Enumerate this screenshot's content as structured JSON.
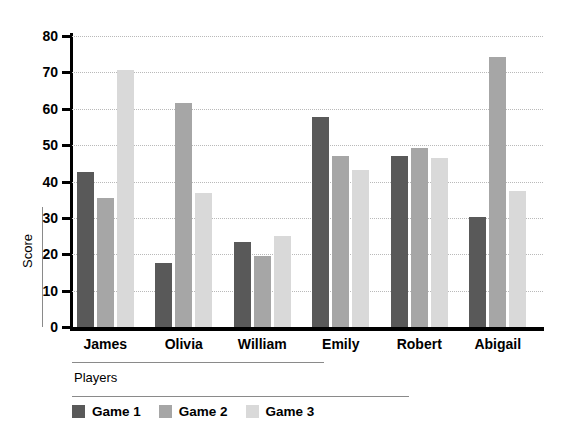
{
  "chart_data": {
    "type": "bar",
    "title": "",
    "subtitle": "",
    "xlabel": "Players",
    "ylabel": "Score",
    "categories": [
      "James",
      "Olivia",
      "William",
      "Emily",
      "Robert",
      "Abigail"
    ],
    "series": [
      {
        "name": "Game 1",
        "color": "#595959",
        "values": [
          42.6,
          17.5,
          23.5,
          57.6,
          47.0,
          30.3
        ]
      },
      {
        "name": "Game 2",
        "color": "#a6a6a6",
        "values": [
          35.5,
          61.5,
          19.4,
          47.0,
          49.3,
          74.3
        ]
      },
      {
        "name": "Game 3",
        "color": "#d9d9d9",
        "values": [
          70.7,
          36.8,
          24.9,
          43.3,
          46.5,
          37.5
        ]
      }
    ],
    "ylim": [
      0,
      80
    ],
    "yticks": [
      0,
      10,
      20,
      30,
      40,
      50,
      60,
      70,
      80
    ],
    "ytick_labels": [
      "0",
      "10",
      "20",
      "30",
      "40",
      "50",
      "60",
      "70",
      "80"
    ],
    "grid": true,
    "grid_axis": "y",
    "grid_style": "dotted",
    "grid_color": "#b9b9b9",
    "legend_position": "bottom-left",
    "legend_entries": [
      "Game 1",
      "Game 2",
      "Game 3"
    ],
    "background": "#ffffff",
    "axis_color": "#000000"
  }
}
